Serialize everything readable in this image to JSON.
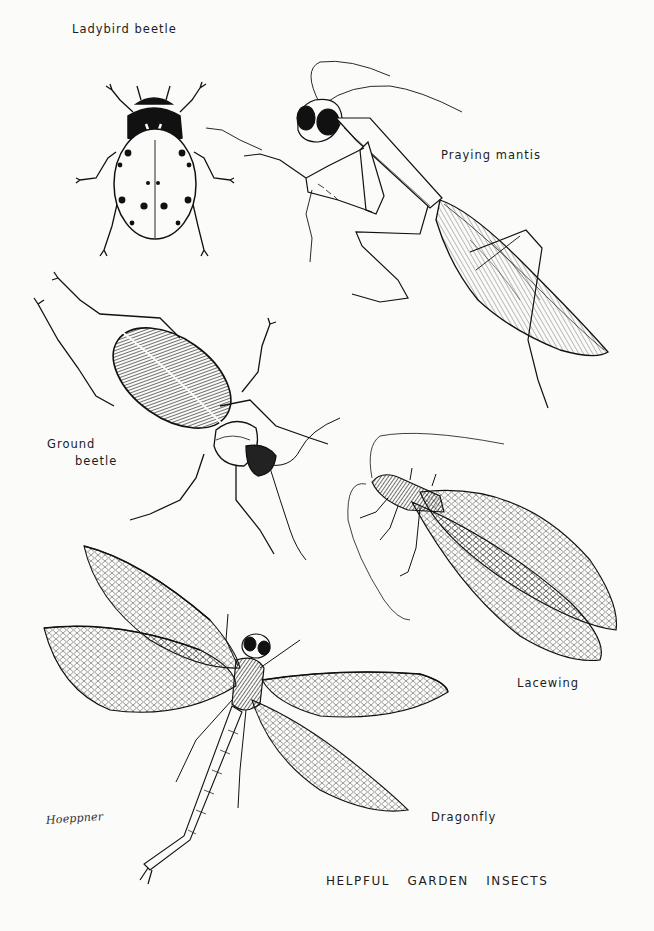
{
  "plate": {
    "title": "HELPFUL GARDEN INSECTS",
    "signature": "Hoeppner",
    "background_color": "#fbfbfa",
    "ink_color": "#1a1a1a"
  },
  "insects": [
    {
      "id": "ladybird",
      "label": "Ladybird beetle"
    },
    {
      "id": "mantis",
      "label": "Praying mantis"
    },
    {
      "id": "ground-beetle",
      "label_line1": "Ground",
      "label_line2": "beetle"
    },
    {
      "id": "lacewing",
      "label": "Lacewing"
    },
    {
      "id": "dragonfly",
      "label": "Dragonfly"
    }
  ]
}
